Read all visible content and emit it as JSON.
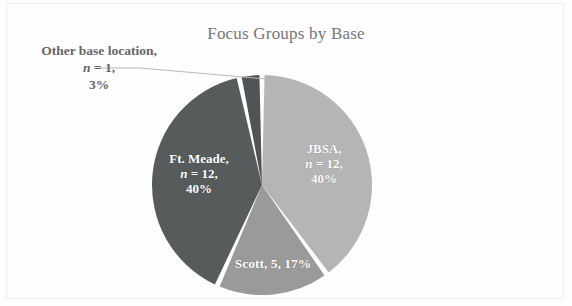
{
  "chart_data": {
    "type": "pie",
    "title": "Focus Groups by Base",
    "categories": [
      "JBSA",
      "Scott",
      "Ft. Meade",
      "Other base location"
    ],
    "values": [
      12,
      5,
      12,
      1
    ],
    "percents": [
      40,
      17,
      40,
      3
    ],
    "total": 30,
    "colors": [
      "#b5b5b5",
      "#9a9a9a",
      "#565b5c",
      "#4f5456"
    ],
    "slice_gap_color": "#ffffff",
    "legend": "none",
    "labels": [
      {
        "key": "jbsa",
        "name": "JBSA",
        "line1": "JBSA,",
        "n_prefix": "n",
        "n_value": " = 12,",
        "line3": "40%",
        "placement": "inside",
        "color": "#ffffff"
      },
      {
        "key": "scott",
        "name": "Scott",
        "line1": "Scott, 5, 17%",
        "placement": "inside",
        "color": "#ffffff"
      },
      {
        "key": "ft-meade",
        "name": "Ft. Meade",
        "line1": "Ft. Meade,",
        "n_prefix": "n",
        "n_value": " = 12,",
        "line3": "40%",
        "placement": "inside",
        "color": "#ffffff"
      },
      {
        "key": "other",
        "name": "Other base location",
        "line1": "Other base location,",
        "n_prefix": "n",
        "n_value": " = 1,",
        "line3": "3%",
        "placement": "outside-left",
        "color": "#666666",
        "has_leader_line": true
      }
    ],
    "geometry": {
      "center_x": 262,
      "center_y": 185,
      "radius": 110,
      "start_angle_deg": -90
    }
  },
  "chart": {
    "title": "Focus Groups by Base"
  }
}
